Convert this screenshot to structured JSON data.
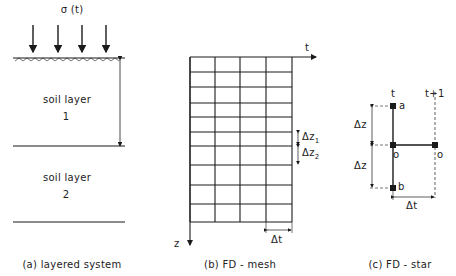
{
  "panel_a": {
    "load_label": "σ (t)",
    "layer1_name": "soil layer",
    "layer1_num": "1",
    "layer2_name": "soil layer",
    "layer2_num": "2",
    "caption": "(a) layered system"
  },
  "panel_b": {
    "t_axis": "t",
    "z_axis": "z",
    "dz1": "Δz",
    "dz1_sub": "1",
    "dz2": "Δz",
    "dz2_sub": "2",
    "dt": "Δt",
    "caption": "(b) FD - mesh",
    "rows": 10,
    "cols": 4
  },
  "panel_c": {
    "t_label": "t",
    "t1_label": "t+1",
    "node_a": "a",
    "node_o": "o",
    "node_o2": "o",
    "node_b": "b",
    "dz_upper": "Δz",
    "dz_lower": "Δz",
    "dt": "Δt",
    "caption": "(c) FD - star"
  }
}
